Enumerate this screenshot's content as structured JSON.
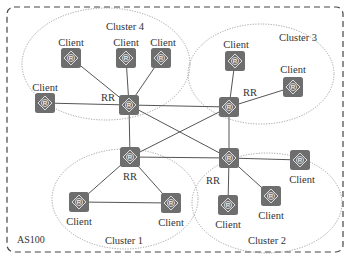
{
  "as": {
    "label": "AS100",
    "border_color": "#444444",
    "box": {
      "x": 7,
      "y": 7,
      "w": 336,
      "h": 245,
      "r": 7
    }
  },
  "colors": {
    "router_fill": "#6e6e6e",
    "router_icon": "#e8e8e8",
    "edge": "#555555",
    "cluster_border": "#8a8a8a",
    "text": "#333333"
  },
  "icon": "router-icon",
  "router_size": 20,
  "clusters": [
    {
      "id": "cluster4",
      "label": "Cluster 4",
      "ellipse": {
        "cx": 106,
        "cy": 64,
        "rx": 84,
        "ry": 56
      },
      "label_pos": {
        "x": 125,
        "y": 30
      }
    },
    {
      "id": "cluster3",
      "label": "Cluster 3",
      "ellipse": {
        "cx": 261,
        "cy": 74,
        "rx": 73,
        "ry": 50
      },
      "label_pos": {
        "x": 298,
        "y": 41
      }
    },
    {
      "id": "cluster1",
      "label": "Cluster 1",
      "ellipse": {
        "cx": 125,
        "cy": 199,
        "rx": 73,
        "ry": 50
      },
      "label_pos": {
        "x": 124,
        "y": 244
      }
    },
    {
      "id": "cluster2",
      "label": "Cluster 2",
      "ellipse": {
        "cx": 267,
        "cy": 203,
        "rx": 75,
        "ry": 50
      },
      "label_pos": {
        "x": 267,
        "y": 244
      }
    }
  ],
  "nodes": [
    {
      "id": "c4_rr",
      "role": "RR",
      "label": "RR",
      "x": 129,
      "y": 105,
      "label_pos": {
        "x": 108,
        "y": 101
      }
    },
    {
      "id": "c4_client1",
      "role": "Client",
      "label": "Client",
      "x": 71,
      "y": 58,
      "label_pos": {
        "x": 71,
        "y": 46
      }
    },
    {
      "id": "c4_client2",
      "role": "Client",
      "label": "Client",
      "x": 126,
      "y": 58,
      "label_pos": {
        "x": 126,
        "y": 46
      }
    },
    {
      "id": "c4_client3",
      "role": "Client",
      "label": "Client",
      "x": 161,
      "y": 58,
      "label_pos": {
        "x": 163,
        "y": 46
      }
    },
    {
      "id": "c4_client4",
      "role": "Client",
      "label": "Client",
      "x": 45,
      "y": 103,
      "label_pos": {
        "x": 45,
        "y": 91
      }
    },
    {
      "id": "c3_rr",
      "role": "RR",
      "label": "RR",
      "x": 229,
      "y": 107,
      "label_pos": {
        "x": 250,
        "y": 96
      }
    },
    {
      "id": "c3_client1",
      "role": "Client",
      "label": "Client",
      "x": 235,
      "y": 61,
      "label_pos": {
        "x": 236,
        "y": 48
      }
    },
    {
      "id": "c3_client2",
      "role": "Client",
      "label": "Client",
      "x": 293,
      "y": 87,
      "label_pos": {
        "x": 293,
        "y": 73
      }
    },
    {
      "id": "c1_rr",
      "role": "RR",
      "label": "RR",
      "x": 130,
      "y": 157,
      "label_pos": {
        "x": 130,
        "y": 180
      }
    },
    {
      "id": "c1_client1",
      "role": "Client",
      "label": "Client",
      "x": 79,
      "y": 202,
      "label_pos": {
        "x": 79,
        "y": 225
      }
    },
    {
      "id": "c1_client2",
      "role": "Client",
      "label": "Client",
      "x": 171,
      "y": 203,
      "label_pos": {
        "x": 171,
        "y": 226
      }
    },
    {
      "id": "c2_rr",
      "role": "RR",
      "label": "RR",
      "x": 229,
      "y": 158,
      "label_pos": {
        "x": 213,
        "y": 184
      }
    },
    {
      "id": "c2_client1",
      "role": "Client",
      "label": "Client",
      "x": 228,
      "y": 205,
      "label_pos": {
        "x": 228,
        "y": 228
      }
    },
    {
      "id": "c2_client2",
      "role": "Client",
      "label": "Client",
      "x": 271,
      "y": 196,
      "label_pos": {
        "x": 271,
        "y": 219
      }
    },
    {
      "id": "c2_client3",
      "role": "Client",
      "label": "Client",
      "x": 300,
      "y": 160,
      "label_pos": {
        "x": 302,
        "y": 183
      }
    }
  ],
  "edges": [
    [
      "c4_rr",
      "c4_client1"
    ],
    [
      "c4_rr",
      "c4_client2"
    ],
    [
      "c4_rr",
      "c4_client3"
    ],
    [
      "c4_rr",
      "c4_client4"
    ],
    [
      "c3_rr",
      "c3_client1"
    ],
    [
      "c3_rr",
      "c3_client2"
    ],
    [
      "c1_rr",
      "c1_client1"
    ],
    [
      "c1_rr",
      "c1_client2"
    ],
    [
      "c1_client1",
      "c1_client2"
    ],
    [
      "c2_rr",
      "c2_client1"
    ],
    [
      "c2_rr",
      "c2_client2"
    ],
    [
      "c2_rr",
      "c2_client3"
    ],
    [
      "c4_rr",
      "c3_rr"
    ],
    [
      "c4_rr",
      "c1_rr"
    ],
    [
      "c4_rr",
      "c2_rr"
    ],
    [
      "c3_rr",
      "c1_rr"
    ],
    [
      "c3_rr",
      "c2_rr"
    ],
    [
      "c1_rr",
      "c2_rr"
    ]
  ]
}
